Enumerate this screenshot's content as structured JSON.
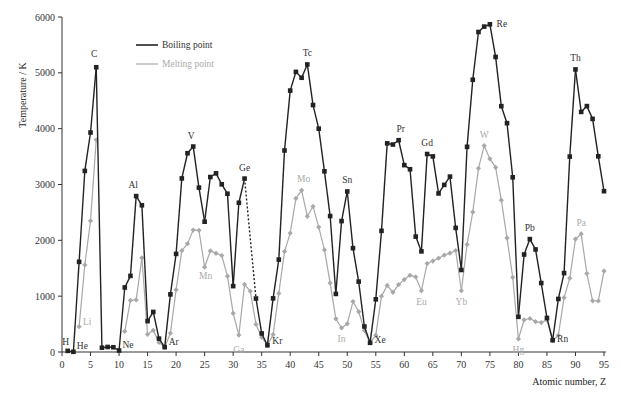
{
  "chart_data": {
    "type": "line",
    "title": "",
    "xlabel": "Atomic number, Z",
    "ylabel": "Temperature / K",
    "xlim": [
      0,
      95
    ],
    "ylim": [
      0,
      6000
    ],
    "xticks": [
      0,
      5,
      10,
      15,
      20,
      25,
      30,
      35,
      40,
      45,
      50,
      55,
      60,
      65,
      70,
      75,
      80,
      85,
      90,
      95
    ],
    "yticks": [
      0,
      1000,
      2000,
      3000,
      4000,
      5000,
      6000
    ],
    "grid": false,
    "legend": {
      "position": "upper-left-inside",
      "entries": [
        "Boiling point",
        "Melting point"
      ]
    },
    "series": [
      {
        "name": "Boiling point",
        "color": "#222222",
        "marker": "square",
        "points": [
          [
            1,
            20
          ],
          [
            2,
            4
          ],
          [
            3,
            1615
          ],
          [
            4,
            3243
          ],
          [
            5,
            3931
          ],
          [
            6,
            5100
          ],
          [
            7,
            77
          ],
          [
            8,
            90
          ],
          [
            9,
            85
          ],
          [
            10,
            27
          ],
          [
            11,
            1156
          ],
          [
            12,
            1363
          ],
          [
            13,
            2792
          ],
          [
            14,
            2628
          ],
          [
            15,
            553
          ],
          [
            16,
            718
          ],
          [
            17,
            239
          ],
          [
            18,
            87
          ],
          [
            19,
            1032
          ],
          [
            20,
            1757
          ],
          [
            21,
            3109
          ],
          [
            22,
            3560
          ],
          [
            23,
            3680
          ],
          [
            24,
            2944
          ],
          [
            25,
            2334
          ],
          [
            26,
            3134
          ],
          [
            27,
            3200
          ],
          [
            28,
            3003
          ],
          [
            29,
            2835
          ],
          [
            30,
            1180
          ],
          [
            31,
            2673
          ],
          [
            32,
            3106
          ],
          [
            34,
            958
          ],
          [
            35,
            332
          ],
          [
            36,
            120
          ],
          [
            37,
            961
          ],
          [
            38,
            1655
          ],
          [
            39,
            3609
          ],
          [
            40,
            4682
          ],
          [
            41,
            5017
          ],
          [
            42,
            4912
          ],
          [
            43,
            5150
          ],
          [
            44,
            4423
          ],
          [
            45,
            4000
          ],
          [
            46,
            3236
          ],
          [
            47,
            2435
          ],
          [
            48,
            1040
          ],
          [
            49,
            2345
          ],
          [
            50,
            2875
          ],
          [
            51,
            1860
          ],
          [
            52,
            1261
          ],
          [
            53,
            457
          ],
          [
            54,
            165
          ],
          [
            55,
            944
          ],
          [
            56,
            2170
          ],
          [
            57,
            3737
          ],
          [
            58,
            3716
          ],
          [
            59,
            3793
          ],
          [
            60,
            3347
          ],
          [
            61,
            3273
          ],
          [
            62,
            2067
          ],
          [
            63,
            1802
          ],
          [
            64,
            3546
          ],
          [
            65,
            3503
          ],
          [
            66,
            2840
          ],
          [
            67,
            2993
          ],
          [
            68,
            3141
          ],
          [
            69,
            2223
          ],
          [
            70,
            1469
          ],
          [
            71,
            3675
          ],
          [
            72,
            4876
          ],
          [
            73,
            5731
          ],
          [
            74,
            5828
          ],
          [
            75,
            5869
          ],
          [
            76,
            5285
          ],
          [
            77,
            4403
          ],
          [
            78,
            4098
          ],
          [
            79,
            3129
          ],
          [
            80,
            630
          ],
          [
            81,
            1746
          ],
          [
            82,
            2022
          ],
          [
            83,
            1837
          ],
          [
            84,
            1235
          ],
          [
            85,
            610
          ],
          [
            86,
            211
          ],
          [
            87,
            950
          ],
          [
            88,
            1413
          ],
          [
            89,
            3500
          ],
          [
            90,
            5061
          ],
          [
            91,
            4300
          ],
          [
            92,
            4404
          ],
          [
            93,
            4175
          ],
          [
            94,
            3505
          ],
          [
            95,
            2880
          ]
        ],
        "dashed_segments": [
          [
            32,
            34
          ]
        ]
      },
      {
        "name": "Melting point",
        "color": "#a8a8a8",
        "marker": "diamond",
        "points": [
          [
            3,
            454
          ],
          [
            4,
            1560
          ],
          [
            5,
            2349
          ],
          [
            6,
            3800
          ],
          [
            11,
            371
          ],
          [
            12,
            923
          ],
          [
            13,
            933
          ],
          [
            14,
            1687
          ],
          [
            15,
            317
          ],
          [
            16,
            388
          ],
          [
            17,
            172
          ],
          [
            18,
            84
          ],
          [
            19,
            337
          ],
          [
            20,
            1115
          ],
          [
            21,
            1814
          ],
          [
            22,
            1941
          ],
          [
            23,
            2183
          ],
          [
            24,
            2180
          ],
          [
            25,
            1519
          ],
          [
            26,
            1811
          ],
          [
            27,
            1768
          ],
          [
            28,
            1728
          ],
          [
            29,
            1358
          ],
          [
            30,
            693
          ],
          [
            31,
            303
          ],
          [
            32,
            1211
          ],
          [
            33,
            1090
          ],
          [
            34,
            494
          ],
          [
            35,
            266
          ],
          [
            36,
            116
          ],
          [
            37,
            312
          ],
          [
            38,
            1050
          ],
          [
            39,
            1799
          ],
          [
            40,
            2128
          ],
          [
            41,
            2750
          ],
          [
            42,
            2896
          ],
          [
            43,
            2430
          ],
          [
            44,
            2607
          ],
          [
            45,
            2237
          ],
          [
            46,
            1828
          ],
          [
            47,
            1235
          ],
          [
            48,
            594
          ],
          [
            49,
            430
          ],
          [
            50,
            505
          ],
          [
            51,
            904
          ],
          [
            52,
            723
          ],
          [
            53,
            387
          ],
          [
            54,
            161
          ],
          [
            55,
            302
          ],
          [
            56,
            1000
          ],
          [
            57,
            1193
          ],
          [
            58,
            1068
          ],
          [
            59,
            1208
          ],
          [
            60,
            1297
          ],
          [
            61,
            1373
          ],
          [
            62,
            1345
          ],
          [
            63,
            1099
          ],
          [
            64,
            1585
          ],
          [
            65,
            1629
          ],
          [
            66,
            1680
          ],
          [
            67,
            1734
          ],
          [
            68,
            1770
          ],
          [
            69,
            1818
          ],
          [
            70,
            1097
          ],
          [
            71,
            1925
          ],
          [
            72,
            2506
          ],
          [
            73,
            3290
          ],
          [
            74,
            3695
          ],
          [
            75,
            3459
          ],
          [
            76,
            3306
          ],
          [
            77,
            2719
          ],
          [
            78,
            2041
          ],
          [
            79,
            1337
          ],
          [
            80,
            234
          ],
          [
            81,
            577
          ],
          [
            82,
            600
          ],
          [
            83,
            544
          ],
          [
            84,
            527
          ],
          [
            85,
            575
          ],
          [
            86,
            202
          ],
          [
            87,
            300
          ],
          [
            88,
            973
          ],
          [
            89,
            1323
          ],
          [
            90,
            2023
          ],
          [
            91,
            2115
          ],
          [
            92,
            1405
          ],
          [
            93,
            917
          ],
          [
            94,
            913
          ],
          [
            95,
            1449
          ]
        ]
      }
    ],
    "annotations": [
      {
        "text": "H",
        "z": 1,
        "series": "Boiling point"
      },
      {
        "text": "He",
        "z": 2,
        "series": "Boiling point"
      },
      {
        "text": "Li",
        "z": 3,
        "series": "Melting point"
      },
      {
        "text": "C",
        "z": 6,
        "series": "Boiling point"
      },
      {
        "text": "Ne",
        "z": 10,
        "series": "Boiling point"
      },
      {
        "text": "Al",
        "z": 13,
        "series": "Boiling point"
      },
      {
        "text": "Ar",
        "z": 18,
        "series": "Boiling point"
      },
      {
        "text": "V",
        "z": 23,
        "series": "Boiling point"
      },
      {
        "text": "Mn",
        "z": 25,
        "series": "Melting point"
      },
      {
        "text": "Ga",
        "z": 31,
        "series": "Melting point"
      },
      {
        "text": "Ge",
        "z": 32,
        "series": "Boiling point"
      },
      {
        "text": "Kr",
        "z": 36,
        "series": "Boiling point"
      },
      {
        "text": "Mo",
        "z": 42,
        "series": "Melting point"
      },
      {
        "text": "Tc",
        "z": 43,
        "series": "Boiling point"
      },
      {
        "text": "In",
        "z": 49,
        "series": "Melting point"
      },
      {
        "text": "Sn",
        "z": 50,
        "series": "Boiling point"
      },
      {
        "text": "Xe",
        "z": 54,
        "series": "Boiling point"
      },
      {
        "text": "Pr",
        "z": 59,
        "series": "Boiling point"
      },
      {
        "text": "Eu",
        "z": 63,
        "series": "Melting point"
      },
      {
        "text": "Gd",
        "z": 64,
        "series": "Boiling point"
      },
      {
        "text": "Yb",
        "z": 70,
        "series": "Melting point"
      },
      {
        "text": "W",
        "z": 74,
        "series": "Melting point"
      },
      {
        "text": "Re",
        "z": 75,
        "series": "Boiling point"
      },
      {
        "text": "Hg",
        "z": 80,
        "series": "Melting point"
      },
      {
        "text": "Pb",
        "z": 82,
        "series": "Boiling point"
      },
      {
        "text": "Rn",
        "z": 86,
        "series": "Boiling point"
      },
      {
        "text": "Th",
        "z": 90,
        "series": "Boiling point"
      },
      {
        "text": "Pa",
        "z": 91,
        "series": "Melting point"
      }
    ]
  },
  "labels": {
    "ylabel": "Temperature / K",
    "xlabel": "Atomic number, Z",
    "legend_boiling": "Boiling point",
    "legend_melting": "Melting point"
  }
}
